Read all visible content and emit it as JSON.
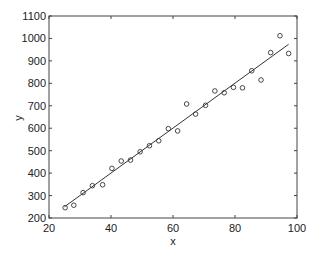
{
  "chart_data": {
    "type": "scatter",
    "title": "",
    "xlabel": "x",
    "ylabel": "y",
    "xlim": [
      20,
      100
    ],
    "ylim": [
      200,
      1100
    ],
    "xticks": [
      20,
      40,
      60,
      80,
      100
    ],
    "yticks": [
      200,
      300,
      400,
      500,
      600,
      700,
      800,
      900,
      1000,
      1100
    ],
    "grid": false,
    "legend": null,
    "series": [
      {
        "name": "data",
        "marker": "circle-open",
        "color": "#333333",
        "x": [
          25.2,
          28,
          31,
          34,
          37.3,
          40.3,
          43.3,
          46.3,
          49.4,
          52.4,
          55.4,
          58.5,
          61.5,
          64.4,
          67.3,
          70.5,
          73.5,
          76.5,
          79.5,
          82.4,
          85.4,
          88.4,
          91.5,
          94.5,
          97.3
        ],
        "y": [
          246,
          257,
          313,
          344,
          348,
          421,
          454,
          458,
          495,
          522,
          544,
          598,
          588,
          708,
          663,
          702,
          766,
          758,
          782,
          780,
          856,
          815,
          937,
          1012,
          933
        ]
      },
      {
        "name": "fit",
        "type": "line",
        "color": "#333333",
        "x": [
          25,
          97.3
        ],
        "y": [
          250,
          974
        ]
      }
    ]
  }
}
